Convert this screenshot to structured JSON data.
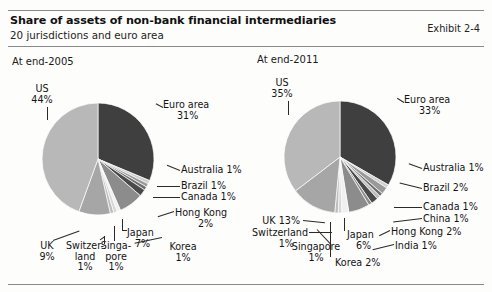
{
  "header": {
    "title": "Share of assets of non-bank financial intermediaries",
    "subtitle": "20 jurisdictions and euro area",
    "exhibit": "Exhibit 2-4"
  },
  "panels": {
    "left_title": "At end-2005",
    "right_title": "At end-2011"
  },
  "labels_2005": {
    "us": "US",
    "us_pct": "44%",
    "euro": "Euro area",
    "euro_pct": "31%",
    "australia": "Australia 1%",
    "brazil": "Brazil 1%",
    "canada": "Canada 1%",
    "hongkong": "Hong Kong",
    "hongkong_pct": "2%",
    "japan": "Japan",
    "japan_pct": "7%",
    "korea": "Korea",
    "korea_pct": "1%",
    "singapore": "Singa-",
    "singapore2": "pore",
    "singapore_pct": "1%",
    "switzerland": "Switzer-",
    "switzerland2": "land",
    "switzerland_pct": "1%",
    "uk": "UK",
    "uk_pct": "9%"
  },
  "labels_2011": {
    "us": "US",
    "us_pct": "35%",
    "euro": "Euro area",
    "euro_pct": "33%",
    "australia": "Australia 1%",
    "brazil": "Brazil 2%",
    "canada": "Canada 1%",
    "china": "China 1%",
    "hongkong": "Hong Kong 2%",
    "india": "India 1%",
    "japan": "Japan",
    "japan_pct": "6%",
    "korea": "Korea 2%",
    "singapore": "Singapore",
    "singapore_pct": "1%",
    "switzerland": "Switzerland",
    "switzerland_pct": "1%",
    "uk": "UK 13%"
  },
  "chart_data": [
    {
      "type": "pie",
      "title": "At end-2005",
      "unit": "percent share of assets",
      "total_labeled": 97,
      "legend_position": "callout-labels",
      "categories": [
        "Euro area",
        "Australia",
        "Brazil",
        "Canada",
        "Hong Kong",
        "Japan",
        "Korea",
        "Singapore",
        "Switzerland",
        "UK",
        "US"
      ],
      "values": [
        31,
        1,
        1,
        1,
        2,
        7,
        1,
        1,
        1,
        9,
        44
      ],
      "colors": [
        "#3f3f3f",
        "#cfcfcf",
        "#9a9a9a",
        "#6f6f6f",
        "#4a4a4a",
        "#8c8c8c",
        "#f0f0f0",
        "#d6d6d6",
        "#bdbdbd",
        "#a6a6a6",
        "#b8b8b8"
      ]
    },
    {
      "type": "pie",
      "title": "At end-2011",
      "unit": "percent share of assets",
      "total_labeled": 98,
      "legend_position": "callout-labels",
      "categories": [
        "Euro area",
        "Australia",
        "Brazil",
        "Canada",
        "China",
        "Hong Kong",
        "India",
        "Japan",
        "Korea",
        "Singapore",
        "Switzerland",
        "UK",
        "US"
      ],
      "values": [
        33,
        1,
        2,
        1,
        1,
        2,
        1,
        6,
        2,
        1,
        1,
        13,
        35
      ],
      "colors": [
        "#3f3f3f",
        "#cfcfcf",
        "#9a9a9a",
        "#6f6f6f",
        "#bdbdbd",
        "#4a4a4a",
        "#8c8c8c",
        "#8c8c8c",
        "#f0f0f0",
        "#d6d6d6",
        "#bdbdbd",
        "#a6a6a6",
        "#b8b8b8"
      ]
    }
  ]
}
